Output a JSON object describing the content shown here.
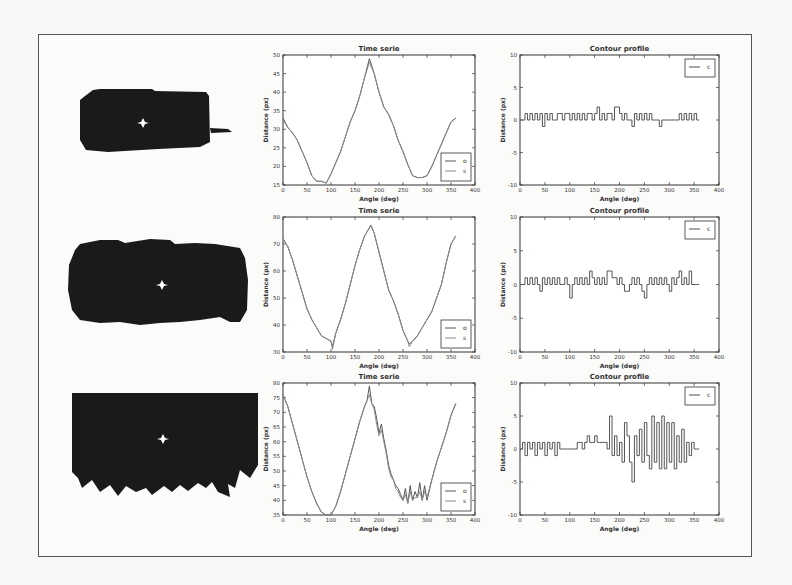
{
  "figure": {
    "rows": [
      {
        "shape": {
          "description": "rounded rectangle blob with tail on right",
          "centroid_marker": "white star"
        },
        "time_series": {
          "title": "Time serie",
          "xlabel": "Angle (deg)",
          "ylabel": "Distance (px)",
          "legend": [
            "o",
            "s"
          ]
        },
        "contour": {
          "title": "Contour profile",
          "xlabel": "Angle (deg)",
          "ylabel": "Distance (px)",
          "legend": [
            "c"
          ]
        }
      },
      {
        "shape": {
          "description": "wide lumpy blob",
          "centroid_marker": "white star"
        },
        "time_series": {
          "title": "Time serie",
          "xlabel": "Angle (deg)",
          "ylabel": "Distance (px)",
          "legend": [
            "o",
            "s"
          ]
        },
        "contour": {
          "title": "Contour profile",
          "xlabel": "Angle (deg)",
          "ylabel": "Distance (px)",
          "legend": [
            "c"
          ]
        }
      },
      {
        "shape": {
          "description": "rectangle with jagged serrated bottom edge",
          "centroid_marker": "white star"
        },
        "time_series": {
          "title": "Time serie",
          "xlabel": "Angle (deg)",
          "ylabel": "Distance (px)",
          "legend": [
            "o",
            "s"
          ]
        },
        "contour": {
          "title": "Contour profile",
          "xlabel": "Angle (deg)",
          "ylabel": "Distance (px)",
          "legend": [
            "c"
          ]
        }
      }
    ]
  },
  "chart_data": [
    {
      "type": "line",
      "title": "Time serie",
      "xlabel": "Angle (deg)",
      "ylabel": "Distance (px)",
      "xlim": [
        0,
        400
      ],
      "ylim": [
        15,
        50
      ],
      "xticks": [
        0,
        50,
        100,
        150,
        200,
        250,
        300,
        350,
        400
      ],
      "yticks": [
        15,
        20,
        25,
        30,
        35,
        40,
        45,
        50
      ],
      "legend_position": "lower right",
      "x": [
        0,
        10,
        20,
        30,
        40,
        50,
        60,
        70,
        80,
        90,
        100,
        110,
        120,
        130,
        140,
        150,
        160,
        170,
        180,
        190,
        200,
        210,
        220,
        230,
        240,
        250,
        260,
        270,
        280,
        290,
        300,
        310,
        320,
        330,
        340,
        350,
        360
      ],
      "series": [
        {
          "name": "o",
          "values": [
            33,
            30.5,
            29,
            27,
            24,
            21,
            17.5,
            16,
            16,
            15.5,
            18,
            21,
            24,
            28,
            32,
            35,
            39,
            44,
            49,
            45,
            40,
            36,
            34,
            31,
            27,
            24,
            20.5,
            17.5,
            17,
            17,
            17.5,
            20,
            23,
            26,
            29,
            32,
            33
          ]
        },
        {
          "name": "s",
          "values": [
            32.5,
            30.5,
            29,
            27,
            24,
            21,
            17.5,
            16,
            16,
            15.5,
            18,
            21,
            24,
            28,
            32,
            35,
            39,
            44,
            48,
            45,
            40,
            36,
            34,
            31,
            27,
            24,
            20.5,
            17.5,
            17,
            17,
            17.5,
            20,
            23,
            26,
            29,
            32,
            33
          ]
        }
      ]
    },
    {
      "type": "line",
      "title": "Contour profile",
      "xlabel": "Angle (deg)",
      "ylabel": "Distance (px)",
      "xlim": [
        0,
        400
      ],
      "ylim": [
        -10,
        10
      ],
      "xticks": [
        0,
        50,
        100,
        150,
        200,
        250,
        300,
        350,
        400
      ],
      "yticks": [
        -10,
        -5,
        0,
        5,
        10
      ],
      "legend_position": "upper right",
      "x": [
        0,
        5,
        10,
        15,
        20,
        25,
        30,
        35,
        40,
        45,
        50,
        55,
        60,
        65,
        70,
        75,
        80,
        85,
        90,
        95,
        100,
        105,
        110,
        115,
        120,
        125,
        130,
        135,
        140,
        145,
        150,
        155,
        160,
        165,
        170,
        175,
        180,
        185,
        190,
        195,
        200,
        205,
        210,
        215,
        220,
        225,
        230,
        235,
        240,
        245,
        250,
        255,
        260,
        265,
        270,
        275,
        280,
        285,
        290,
        295,
        300,
        305,
        310,
        315,
        320,
        325,
        330,
        335,
        340,
        345,
        350,
        355,
        360
      ],
      "series": [
        {
          "name": "c",
          "values": [
            0,
            0,
            1,
            0,
            1,
            0,
            1,
            0,
            1,
            -1,
            1,
            0,
            1,
            0,
            0,
            1,
            1,
            0,
            1,
            1,
            0,
            1,
            0,
            1,
            0,
            1,
            0,
            1,
            1,
            0,
            1,
            2,
            0,
            1,
            0,
            1,
            1,
            0,
            2,
            2,
            1,
            0,
            1,
            0,
            0,
            -1,
            1,
            0,
            1,
            0,
            1,
            0,
            1,
            0,
            0,
            0,
            -1,
            0,
            0,
            0,
            0,
            0,
            0,
            0,
            1,
            0,
            1,
            0,
            1,
            0,
            1,
            0,
            0
          ]
        }
      ]
    },
    {
      "type": "line",
      "title": "Time serie",
      "xlabel": "Angle (deg)",
      "ylabel": "Distance (px)",
      "xlim": [
        0,
        400
      ],
      "ylim": [
        30,
        80
      ],
      "xticks": [
        0,
        50,
        100,
        150,
        200,
        250,
        300,
        350,
        400
      ],
      "yticks": [
        30,
        40,
        50,
        60,
        70,
        80
      ],
      "legend_position": "lower right",
      "x": [
        0,
        10,
        20,
        30,
        40,
        50,
        60,
        70,
        80,
        90,
        100,
        103,
        110,
        120,
        130,
        140,
        150,
        160,
        170,
        180,
        183,
        190,
        200,
        210,
        220,
        230,
        240,
        250,
        260,
        263,
        270,
        280,
        290,
        300,
        310,
        320,
        330,
        340,
        350,
        360
      ],
      "series": [
        {
          "name": "o",
          "values": [
            72,
            69,
            64,
            58,
            52,
            46,
            42,
            39,
            36,
            35,
            34,
            32,
            37,
            42,
            48,
            55,
            62,
            68,
            73,
            76,
            77,
            74,
            67,
            60,
            53,
            49,
            44,
            38,
            34,
            33,
            34,
            36,
            39,
            42,
            45,
            50,
            55,
            63,
            70,
            73
          ]
        },
        {
          "name": "s",
          "values": [
            72,
            69,
            64,
            58,
            52,
            46,
            42,
            39,
            36,
            35,
            34,
            31,
            37,
            42,
            48,
            55,
            62,
            68,
            73,
            76,
            77,
            74,
            67,
            60,
            53,
            49,
            44,
            38,
            34,
            32,
            34,
            36,
            39,
            42,
            45,
            50,
            55,
            63,
            70,
            73
          ]
        }
      ]
    },
    {
      "type": "line",
      "title": "Contour profile",
      "xlabel": "Angle (deg)",
      "ylabel": "Distance (px)",
      "xlim": [
        0,
        400
      ],
      "ylim": [
        -10,
        10
      ],
      "xticks": [
        0,
        50,
        100,
        150,
        200,
        250,
        300,
        350,
        400
      ],
      "yticks": [
        -10,
        -5,
        0,
        5,
        10
      ],
      "legend_position": "upper right",
      "x": [
        0,
        5,
        10,
        15,
        20,
        25,
        30,
        35,
        40,
        45,
        50,
        55,
        60,
        65,
        70,
        75,
        80,
        85,
        90,
        95,
        100,
        105,
        110,
        115,
        120,
        125,
        130,
        135,
        140,
        145,
        150,
        155,
        160,
        165,
        170,
        175,
        180,
        185,
        190,
        195,
        200,
        205,
        210,
        215,
        220,
        225,
        230,
        235,
        240,
        245,
        250,
        255,
        260,
        265,
        270,
        275,
        280,
        285,
        290,
        295,
        300,
        305,
        310,
        315,
        320,
        325,
        330,
        335,
        340,
        345,
        350,
        355,
        360
      ],
      "series": [
        {
          "name": "c",
          "values": [
            0,
            0,
            1,
            0,
            1,
            0,
            1,
            0,
            -1,
            1,
            0,
            1,
            0,
            1,
            0,
            1,
            0,
            0,
            1,
            0,
            -2,
            0,
            1,
            0,
            1,
            0,
            1,
            0,
            2,
            1,
            0,
            1,
            0,
            1,
            0,
            2,
            2,
            1,
            1,
            0,
            1,
            0,
            -1,
            -1,
            0,
            1,
            0,
            1,
            0,
            -1,
            -2,
            0,
            1,
            0,
            1,
            0,
            1,
            0,
            1,
            0,
            -1,
            1,
            0,
            1,
            2,
            0,
            1,
            0,
            2,
            0,
            0,
            0,
            0
          ]
        }
      ]
    },
    {
      "type": "line",
      "title": "Time serie",
      "xlabel": "Angle (deg)",
      "ylabel": "Distance (px)",
      "xlim": [
        0,
        400
      ],
      "ylim": [
        35,
        80
      ],
      "xticks": [
        0,
        50,
        100,
        150,
        200,
        250,
        300,
        350,
        400
      ],
      "yticks": [
        35,
        40,
        45,
        50,
        55,
        60,
        65,
        70,
        75,
        80
      ],
      "legend_position": "lower right",
      "x": [
        0,
        10,
        20,
        30,
        40,
        50,
        60,
        70,
        80,
        90,
        100,
        110,
        120,
        130,
        140,
        150,
        160,
        170,
        175,
        180,
        185,
        190,
        195,
        200,
        205,
        210,
        215,
        220,
        225,
        230,
        235,
        240,
        245,
        250,
        255,
        260,
        265,
        270,
        275,
        280,
        285,
        290,
        295,
        300,
        310,
        320,
        330,
        340,
        350,
        360
      ],
      "series": [
        {
          "name": "o",
          "values": [
            76,
            72,
            66,
            60,
            54,
            48,
            43,
            39,
            36,
            35,
            35,
            38,
            43,
            49,
            55,
            61,
            67,
            72,
            74,
            79,
            73,
            72,
            68,
            63,
            66,
            61,
            57,
            52,
            49,
            47,
            45,
            44,
            42,
            40,
            44,
            39,
            45,
            40,
            43,
            41,
            46,
            40,
            45,
            40,
            47,
            53,
            58,
            63,
            69,
            73
          ]
        },
        {
          "name": "s",
          "values": [
            76,
            72,
            66,
            60,
            54,
            48,
            43,
            39,
            36,
            35,
            35,
            38,
            43,
            49,
            55,
            61,
            67,
            72,
            74,
            76,
            73,
            71,
            66,
            62,
            64,
            60,
            56,
            51,
            48,
            47,
            44,
            43,
            41,
            40,
            42,
            39,
            43,
            40,
            41,
            41,
            43,
            40,
            43,
            41,
            47,
            53,
            58,
            63,
            69,
            73
          ]
        }
      ]
    },
    {
      "type": "line",
      "title": "Contour profile",
      "xlabel": "Angle (deg)",
      "ylabel": "Distance (px)",
      "xlim": [
        0,
        400
      ],
      "ylim": [
        -10,
        10
      ],
      "xticks": [
        0,
        50,
        100,
        150,
        200,
        250,
        300,
        350,
        400
      ],
      "yticks": [
        -10,
        -5,
        0,
        5,
        10
      ],
      "legend_position": "upper right",
      "x": [
        0,
        5,
        10,
        15,
        20,
        25,
        30,
        35,
        40,
        45,
        50,
        55,
        60,
        65,
        70,
        75,
        80,
        85,
        90,
        95,
        100,
        105,
        110,
        115,
        120,
        125,
        130,
        135,
        140,
        145,
        150,
        155,
        160,
        165,
        170,
        175,
        180,
        185,
        190,
        195,
        200,
        205,
        210,
        215,
        220,
        225,
        230,
        235,
        240,
        245,
        250,
        255,
        260,
        265,
        270,
        275,
        280,
        285,
        290,
        295,
        300,
        305,
        310,
        315,
        320,
        325,
        330,
        335,
        340,
        345,
        350,
        355,
        360
      ],
      "series": [
        {
          "name": "c",
          "values": [
            0,
            1,
            -1,
            1,
            0,
            1,
            -1,
            1,
            0,
            1,
            -1,
            1,
            0,
            1,
            -1,
            1,
            0,
            0,
            0,
            0,
            0,
            0,
            0,
            1,
            1,
            0,
            1,
            2,
            1,
            1,
            2,
            1,
            1,
            1,
            1,
            0,
            5,
            -1,
            2,
            -1,
            1,
            -2,
            4,
            2,
            -2,
            -5,
            2,
            -1,
            3,
            -2,
            4,
            -1,
            -3,
            5,
            -2,
            4,
            -3,
            5,
            -3,
            4,
            -2,
            4,
            -3,
            2,
            -2,
            3,
            -2,
            1,
            -1,
            1,
            0,
            0,
            0
          ]
        }
      ]
    }
  ]
}
